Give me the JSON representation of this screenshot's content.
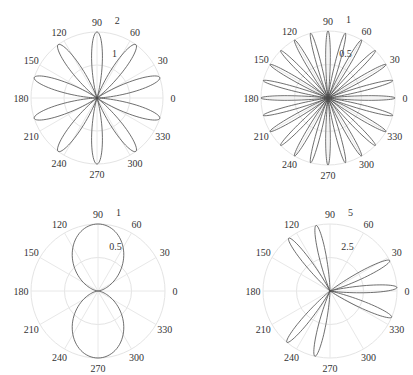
{
  "chart_data": [
    {
      "type": "polar-line",
      "title": "",
      "description": "10-petal rose",
      "equation_estimate": "r = 2*sin(5*theta)^2",
      "center": [
        97,
        98
      ],
      "radius_px": 66,
      "rmax": 2,
      "rticks": [
        1,
        2
      ],
      "rtick_labels": [
        "1",
        "2"
      ],
      "angle_ticks": [
        "0",
        "30",
        "60",
        "90",
        "120",
        "150",
        "180",
        "210",
        "240",
        "270",
        "300",
        "330"
      ],
      "petal_tip_angles_deg": [
        18,
        54,
        90,
        126,
        162,
        198,
        234,
        270,
        306,
        342
      ],
      "petal_length": 2
    },
    {
      "type": "polar-line",
      "title": "",
      "description": "24-petal rose",
      "equation_estimate": "r = cos(12*theta)^2",
      "center": [
        328,
        98
      ],
      "radius_px": 67,
      "rmax": 1,
      "rticks": [
        0.5,
        1
      ],
      "rtick_labels": [
        "0.5",
        "1"
      ],
      "angle_ticks": [
        "0",
        "30",
        "60",
        "90",
        "120",
        "150",
        "180",
        "210",
        "240",
        "270",
        "300",
        "330"
      ],
      "petal_tip_angles_deg": [
        0,
        15,
        30,
        45,
        60,
        75,
        90,
        105,
        120,
        135,
        150,
        165,
        180,
        195,
        210,
        225,
        240,
        255,
        270,
        285,
        300,
        315,
        330,
        345
      ],
      "petal_length": 1
    },
    {
      "type": "polar-line",
      "title": "",
      "description": "figure-eight (two lobes along 90/270)",
      "equation_estimate": "r = sin(theta)^2",
      "center": [
        98,
        291
      ],
      "radius_px": 67,
      "rmax": 1,
      "rticks": [
        0.5,
        1
      ],
      "rtick_labels": [
        "0.5",
        "1"
      ],
      "angle_ticks": [
        "0",
        "30",
        "60",
        "90",
        "120",
        "150",
        "180",
        "210",
        "240",
        "270",
        "300",
        "330"
      ],
      "petal_tip_angles_deg": [
        90,
        270
      ],
      "petal_length": 1
    },
    {
      "type": "polar-line",
      "title": "",
      "description": "irregular 7-petal curve",
      "center": [
        330,
        291
      ],
      "radius_px": 67,
      "rmax": 5,
      "rticks": [
        2.5,
        5
      ],
      "rtick_labels": [
        "2.5",
        "5"
      ],
      "angle_ticks": [
        "0",
        "30",
        "60",
        "90",
        "120",
        "150",
        "180",
        "210",
        "240",
        "270",
        "300",
        "330"
      ],
      "petal_tip_angles_deg": [
        3,
        27,
        102,
        128,
        230,
        257,
        337
      ],
      "petal_length": 5
    }
  ],
  "plots": [
    {
      "rlabel_outer": "2",
      "rlabel_inner": "1",
      "ticks": {
        "a0": "0",
        "a30": "30",
        "a60": "60",
        "a90": "90",
        "a120": "120",
        "a150": "150",
        "a180": "180",
        "a210": "210",
        "a240": "240",
        "a270": "270",
        "a300": "300",
        "a330": "330"
      }
    },
    {
      "rlabel_outer": "1",
      "rlabel_inner": "0.5",
      "ticks": {
        "a0": "0",
        "a30": "30",
        "a60": "60",
        "a90": "90",
        "a120": "120",
        "a150": "150",
        "a180": "180",
        "a210": "210",
        "a240": "240",
        "a270": "270",
        "a300": "300",
        "a330": "330"
      }
    },
    {
      "rlabel_outer": "1",
      "rlabel_inner": "0.5",
      "ticks": {
        "a0": "0",
        "a30": "30",
        "a60": "60",
        "a90": "90",
        "a120": "120",
        "a150": "150",
        "a180": "180",
        "a210": "210",
        "a240": "240",
        "a270": "270",
        "a300": "300",
        "a330": "330"
      }
    },
    {
      "rlabel_outer": "5",
      "rlabel_inner": "2.5",
      "ticks": {
        "a0": "0",
        "a30": "30",
        "a60": "60",
        "a90": "90",
        "a120": "120",
        "a150": "150",
        "a180": "180",
        "a210": "210",
        "a240": "240",
        "a270": "270",
        "a300": "300",
        "a330": "330"
      }
    }
  ],
  "colors": {
    "curve": "#4a4a4a",
    "grid": "#e4e4e4",
    "text": "#333333",
    "background": "#ffffff"
  }
}
